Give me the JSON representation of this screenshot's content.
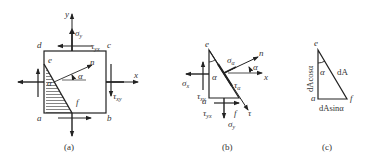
{
  "panels": [
    {
      "caption": "(a)",
      "labels": {
        "y": "y",
        "x": "x",
        "n": "n",
        "a": "a",
        "b": "b",
        "c": "c",
        "d": "d",
        "e": "e",
        "f": "f",
        "alpha": "α",
        "alpha2": "α",
        "sigma_y": "σ",
        "sigma_y_sub": "y",
        "tau_yx": "τ",
        "tau_yx_sub": "yx",
        "tau_xy": "τ",
        "tau_xy_sub": "xy"
      }
    },
    {
      "caption": "(b)",
      "labels": {
        "e": "e",
        "a": "a",
        "f": "f",
        "n": "n",
        "x": "x",
        "tau": "τ",
        "alpha": "α",
        "alpha2": "α",
        "sigma_alpha": "σ",
        "sigma_alpha_sub": "α",
        "tau_alpha": "τ",
        "tau_alpha_sub": "α",
        "sigma_x": "σ",
        "sigma_x_sub": "x",
        "tau_xy": "τ",
        "tau_xy_sub": "xy",
        "tau_yx": "τ",
        "tau_yx_sub": "yx",
        "sigma_y": "σ",
        "sigma_y_sub": "y"
      }
    },
    {
      "caption": "(c)",
      "labels": {
        "e": "e",
        "a": "a",
        "f": "f",
        "alpha": "α",
        "dA": "dA",
        "dAcos": "dAcosα",
        "dAsin": "dAsinα"
      }
    }
  ]
}
